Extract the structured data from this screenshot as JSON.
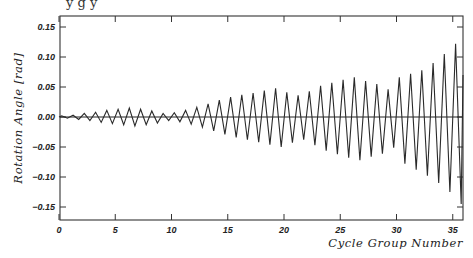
{
  "chart_data": {
    "type": "line",
    "title": "",
    "xlabel": "Cycle Group Number",
    "ylabel": "Rotation Angle [rad]",
    "xlim": [
      0,
      36
    ],
    "ylim": [
      -0.17,
      0.17
    ],
    "x_ticks": [
      0,
      5,
      10,
      15,
      20,
      25,
      30,
      35
    ],
    "x_tick_labels": [
      "0",
      "5",
      "10",
      "15",
      "20",
      "25",
      "30",
      "35"
    ],
    "y_ticks": [
      0.15,
      0.1,
      0.05,
      0.0,
      -0.05,
      -0.1,
      -0.15
    ],
    "y_tick_labels": [
      "0.15",
      "0.10",
      "0.05",
      "0.00",
      "-0.05",
      "-0.10",
      "-0.15"
    ],
    "grid": false,
    "legend": null,
    "zero_line": true,
    "series": [
      {
        "name": "Rotation Angle",
        "description": "Cyclic rotation history; one positive peak and one negative trough per cycle",
        "cycle_peaks": [
          0.002,
          0.003,
          0.006,
          0.008,
          0.011,
          0.013,
          0.015,
          0.013,
          0.01,
          0.006,
          0.007,
          0.011,
          0.016,
          0.022,
          0.028,
          0.033,
          0.037,
          0.04,
          0.044,
          0.048,
          0.041,
          0.036,
          0.043,
          0.052,
          0.057,
          0.062,
          0.066,
          0.06,
          0.055,
          0.046,
          0.066,
          0.072,
          0.078,
          0.09,
          0.105,
          0.122
        ],
        "cycle_troughs": [
          -0.002,
          -0.004,
          -0.006,
          -0.009,
          -0.011,
          -0.013,
          -0.015,
          -0.013,
          -0.01,
          -0.006,
          -0.008,
          -0.012,
          -0.017,
          -0.023,
          -0.029,
          -0.034,
          -0.038,
          -0.042,
          -0.046,
          -0.05,
          -0.043,
          -0.038,
          -0.047,
          -0.056,
          -0.062,
          -0.068,
          -0.072,
          -0.066,
          -0.061,
          -0.051,
          -0.078,
          -0.088,
          -0.098,
          -0.11,
          -0.125,
          -0.145
        ]
      }
    ]
  },
  "caption_fragment": "y          g      y"
}
